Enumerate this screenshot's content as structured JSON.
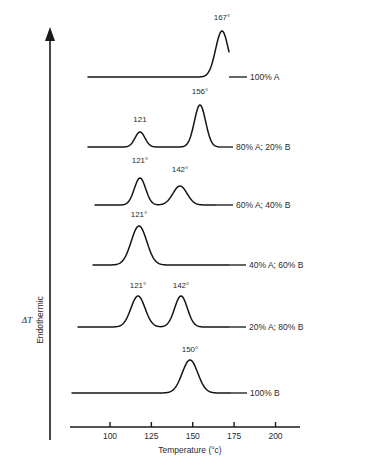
{
  "figure": {
    "kind": "dsc-thermogram-stack",
    "background_color": "#ffffff",
    "line_color": "#141414",
    "text_color": "#2a2a2a"
  },
  "axes": {
    "y_axis": {
      "arrow_label": "Endothermic",
      "quantity_label": "ΔT",
      "direction": "up"
    },
    "x_axis": {
      "title": "Temperature (°c)",
      "ticks": [
        100,
        125,
        150,
        175,
        200
      ],
      "tick_labels": [
        "100",
        "125",
        "150",
        "175",
        "200"
      ],
      "range": [
        83,
        215
      ]
    }
  },
  "chart_data": {
    "type": "line",
    "title": "",
    "xlabel": "Temperature (°c)",
    "ylabel": "ΔT",
    "ylabel_secondary": "Endothermic",
    "xlim": [
      83,
      215
    ],
    "grid": false,
    "legend_position": "right-inline",
    "tick_labels_x": [
      "100",
      "125",
      "150",
      "175",
      "200"
    ],
    "series": [
      {
        "name": "100% A",
        "label": "100% A",
        "baseline_y": 77,
        "label_x": 250,
        "label_y": 80,
        "leader_x1": 229,
        "leader_x2": 247,
        "trace_x_start": 88,
        "trace_x_end": 229,
        "peaks": [
          {
            "temperature": 167,
            "label": "167°",
            "center_x": 222,
            "height": 46,
            "width": 9,
            "label_x": 222,
            "label_y": 20
          }
        ]
      },
      {
        "name": "80% A; 20% B",
        "label": "80% A; 20% B",
        "baseline_y": 147,
        "label_x": 236,
        "label_y": 150,
        "leader_x1": 218,
        "leader_x2": 233,
        "trace_x_start": 88,
        "trace_x_end": 218,
        "peaks": [
          {
            "temperature": 121,
            "label": "121",
            "center_x": 140,
            "height": 15,
            "width": 7,
            "label_x": 140,
            "label_y": 122
          },
          {
            "temperature": 156,
            "label": "156°",
            "center_x": 200,
            "height": 42,
            "width": 8,
            "label_x": 200,
            "label_y": 94
          }
        ]
      },
      {
        "name": "60% A; 40% B",
        "label": "60% A; 40% B",
        "baseline_y": 205,
        "label_x": 236,
        "label_y": 208,
        "leader_x1": 216,
        "leader_x2": 233,
        "trace_x_start": 95,
        "trace_x_end": 216,
        "peaks": [
          {
            "temperature": 121,
            "label": "121°",
            "center_x": 140,
            "height": 27,
            "width": 8,
            "label_x": 140,
            "label_y": 163
          },
          {
            "temperature": 142,
            "label": "142°",
            "center_x": 180,
            "height": 19,
            "width": 10,
            "label_x": 180,
            "label_y": 172
          }
        ]
      },
      {
        "name": "40% A; 60% B",
        "label": "40% A; 60% B",
        "baseline_y": 265,
        "label_x": 249,
        "label_y": 268,
        "leader_x1": 228,
        "leader_x2": 246,
        "trace_x_start": 93,
        "trace_x_end": 228,
        "peaks": [
          {
            "temperature": 121,
            "label": "121°",
            "center_x": 139,
            "height": 39,
            "width": 11,
            "label_x": 139,
            "label_y": 217
          }
        ]
      },
      {
        "name": "20% A; 80% B",
        "label": "20% A; 80% B",
        "baseline_y": 327,
        "label_x": 249,
        "label_y": 330,
        "leader_x1": 228,
        "leader_x2": 246,
        "trace_x_start": 78,
        "trace_x_end": 228,
        "peaks": [
          {
            "temperature": 121,
            "label": "121°",
            "center_x": 138,
            "height": 31,
            "width": 10,
            "label_x": 138,
            "label_y": 288
          },
          {
            "temperature": 142,
            "label": "142°",
            "center_x": 181,
            "height": 31,
            "width": 9,
            "label_x": 181,
            "label_y": 288
          }
        ]
      },
      {
        "name": "100% B",
        "label": "100% B",
        "baseline_y": 393,
        "label_x": 250,
        "label_y": 396,
        "leader_x1": 230,
        "leader_x2": 247,
        "trace_x_start": 72,
        "trace_x_end": 230,
        "peaks": [
          {
            "temperature": 150,
            "label": "150°",
            "center_x": 190,
            "height": 33,
            "width": 11,
            "label_x": 190,
            "label_y": 352
          }
        ]
      }
    ]
  },
  "geometry": {
    "y_axis_x": 50,
    "y_axis_top": 27,
    "y_axis_bottom": 440,
    "x_axis_y": 427,
    "x_axis_left": 70,
    "x_axis_right": 300,
    "x_pixel_at_100": 110,
    "x_pixel_per_degree": 1.655,
    "tick_height": 5,
    "axis_title_x": 190,
    "axis_title_y": 453,
    "endothermic_label_x": 43,
    "endothermic_label_y": 320,
    "delta_t_label_x": 27,
    "delta_t_label_y": 323
  }
}
